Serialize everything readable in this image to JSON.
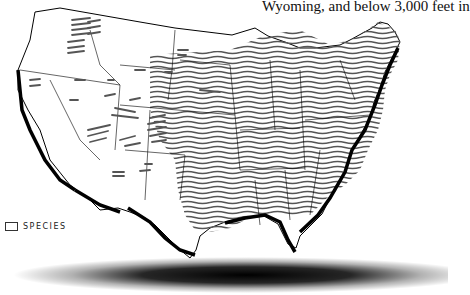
{
  "caption": "Wyoming, and below 3,000 feet in",
  "legend": {
    "icon": "hatched-lines-swatch",
    "label": "SPECIES"
  },
  "map": {
    "subject": "Contiguous United States species range map",
    "fill_pattern": "wavy horizontal hatch lines",
    "hatch_color": "#555555",
    "border_color": "#000000",
    "coastline_color": "#000000",
    "dense_region": "eastern United States (Great Plains eastward)",
    "sparse_region": "western mountain states (scattered dashes)"
  }
}
